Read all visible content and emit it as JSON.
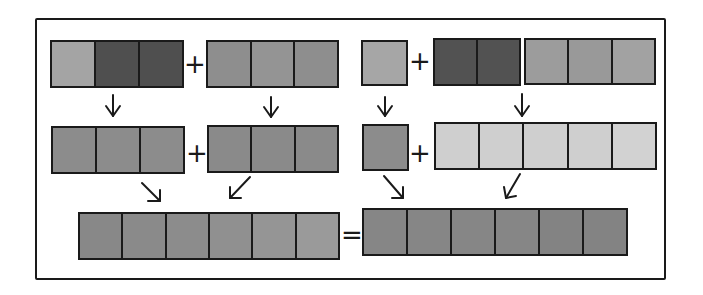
{
  "diagram": {
    "colors": {
      "dark": "#4f4f4f",
      "medium": "#8c8c8c",
      "medium_light": "#9c9c9c",
      "light_medium": "#a4a4a4",
      "light": "#cfcfcf",
      "outline": "#1a1a1a"
    },
    "operators": {
      "plus": "+",
      "equals": "="
    },
    "rows": {
      "top": {
        "left_group": {
          "block_a": [
            "light_medium",
            "dark",
            "dark"
          ],
          "block_b": [
            "medium",
            "medium",
            "medium"
          ]
        },
        "right_group": {
          "block_c": [
            "light_medium"
          ],
          "block_d": [
            "dark",
            "dark"
          ],
          "block_e": [
            "medium_light",
            "medium_light",
            "medium_light"
          ]
        }
      },
      "middle": {
        "left_group": {
          "block_f": [
            "medium",
            "medium",
            "medium"
          ],
          "block_g": [
            "medium",
            "medium",
            "medium"
          ]
        },
        "right_group": {
          "block_h": [
            "medium"
          ],
          "block_i": [
            "light",
            "light",
            "light",
            "light",
            "light"
          ]
        }
      },
      "bottom": {
        "block_j": [
          "medium",
          "medium",
          "medium",
          "medium",
          "medium",
          "medium"
        ],
        "block_k": [
          "medium",
          "medium",
          "medium",
          "medium",
          "medium",
          "medium"
        ]
      }
    },
    "arrows": [
      {
        "from": "block_a",
        "to": "block_f",
        "direction": "down"
      },
      {
        "from": "block_b",
        "to": "block_g",
        "direction": "down"
      },
      {
        "from": "block_c",
        "to": "block_h",
        "direction": "down"
      },
      {
        "from": "block_d+block_e",
        "to": "block_i",
        "direction": "down"
      },
      {
        "from": "block_f",
        "to": "block_j",
        "direction": "down-right"
      },
      {
        "from": "block_g",
        "to": "block_j",
        "direction": "down-left"
      },
      {
        "from": "block_h",
        "to": "block_k",
        "direction": "down-right"
      },
      {
        "from": "block_i",
        "to": "block_k",
        "direction": "down-left"
      }
    ]
  }
}
